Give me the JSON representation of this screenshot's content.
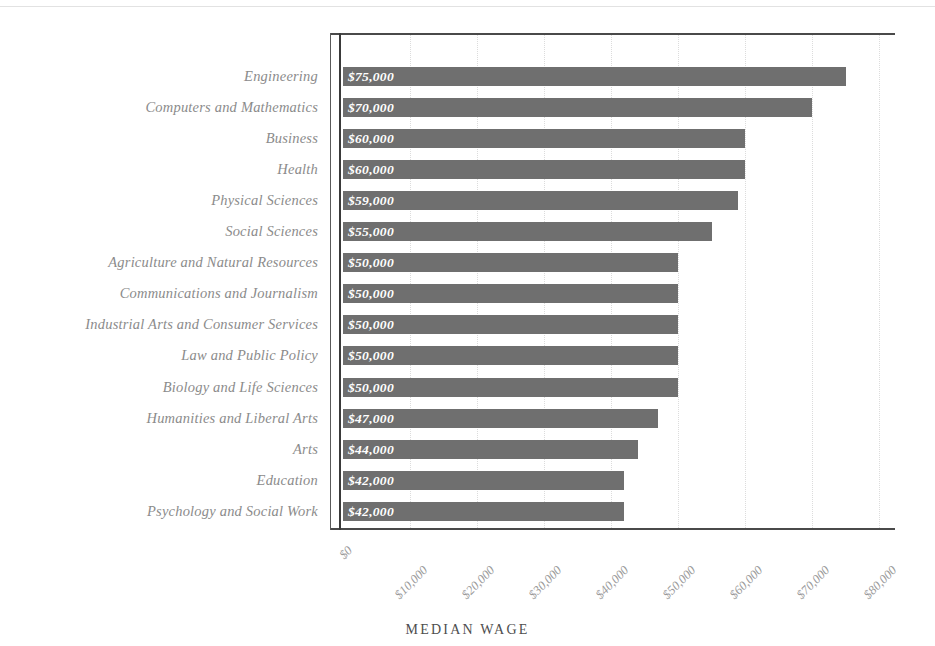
{
  "chart_data": {
    "type": "bar",
    "orientation": "horizontal",
    "title": "",
    "xlabel": "MEDIAN WAGE",
    "ylabel": "",
    "xlim": [
      0,
      84000
    ],
    "grid": true,
    "legend": false,
    "categories": [
      "Engineering",
      "Computers and Mathematics",
      "Business",
      "Health",
      "Physical Sciences",
      "Social Sciences",
      "Agriculture and Natural Resources",
      "Communications and Journalism",
      "Industrial Arts and Consumer Services",
      "Law and Public Policy",
      "Biology and Life Sciences",
      "Humanities and Liberal Arts",
      "Arts",
      "Education",
      "Psychology and Social Work"
    ],
    "values": [
      75000,
      70000,
      60000,
      60000,
      59000,
      55000,
      50000,
      50000,
      50000,
      50000,
      50000,
      47000,
      44000,
      42000,
      42000
    ],
    "value_labels": [
      "$75,000",
      "$70,000",
      "$60,000",
      "$60,000",
      "$59,000",
      "$55,000",
      "$50,000",
      "$50,000",
      "$50,000",
      "$50,000",
      "$50,000",
      "$47,000",
      "$44,000",
      "$42,000",
      "$42,000"
    ],
    "xticks": [
      0,
      10000,
      20000,
      30000,
      40000,
      50000,
      60000,
      70000,
      80000
    ],
    "xtick_labels": [
      "$0",
      "$10,000",
      "$20,000",
      "$30,000",
      "$40,000",
      "$50,000",
      "$60,000",
      "$70,000",
      "$80,000"
    ],
    "bar_color": "#6f6f6f",
    "value_label_color": "#ffffff",
    "category_label_color": "#8b8b8b",
    "tick_label_color": "#9a9a9a",
    "grid_color": "#dcdcdc",
    "axis_color": "#4a4a4a",
    "background_color": "#ffffff"
  }
}
